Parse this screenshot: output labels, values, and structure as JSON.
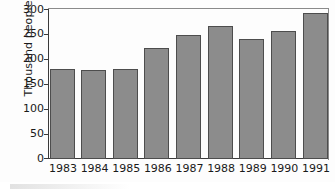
{
  "chart_data": {
    "type": "bar",
    "title": "",
    "xlabel": "",
    "ylabel": "Thousand people",
    "categories": [
      "1983",
      "1984",
      "1985",
      "1986",
      "1987",
      "1988",
      "1989",
      "1990",
      "1991"
    ],
    "values": [
      180,
      178,
      181,
      223,
      249,
      267,
      241,
      256,
      293
    ],
    "ylim": [
      0,
      300
    ],
    "ytick_labels": [
      "300",
      "250",
      "200",
      "150",
      "100",
      "50",
      "0"
    ],
    "ytick_values": [
      300,
      250,
      200,
      150,
      100,
      50,
      0
    ],
    "grid": false,
    "legend": null,
    "bar_color": "#8c8c8c",
    "bar_edge_color": "#4d4d4d",
    "axis_color": "#3a3a3a",
    "background_color": "#fdfdfd"
  }
}
